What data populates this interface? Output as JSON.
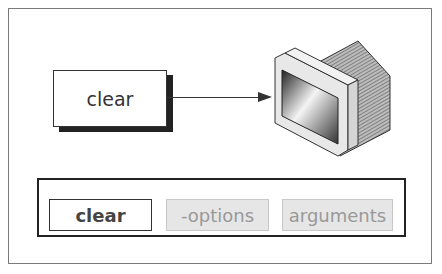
{
  "diagram": {
    "command_box": {
      "label": "clear"
    },
    "arrow": {
      "from": "command_box",
      "to": "monitor"
    },
    "monitor": {
      "icon": "crt-monitor-icon"
    },
    "syntax": {
      "tokens": [
        {
          "label": "clear",
          "style": "bold-outlined"
        },
        {
          "label": "-options",
          "style": "grey-shaded"
        },
        {
          "label": "arguments",
          "style": "grey-shaded"
        }
      ]
    },
    "colors": {
      "frame": "#7a7a7a",
      "ink": "#333333",
      "shade": "#e6e6e6",
      "muted_text": "#999999"
    }
  }
}
